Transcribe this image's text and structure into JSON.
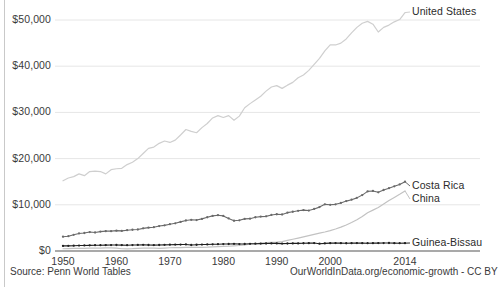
{
  "axes": {
    "y_ticks": [
      {
        "label": "$50,000",
        "value": 50000
      },
      {
        "label": "$40,000",
        "value": 40000
      },
      {
        "label": "$30,000",
        "value": 30000
      },
      {
        "label": "$20,000",
        "value": 20000
      },
      {
        "label": "$10,000",
        "value": 10000
      },
      {
        "label": "$0",
        "value": 0
      }
    ],
    "x_ticks": [
      {
        "label": "1950",
        "value": 1950
      },
      {
        "label": "1960",
        "value": 1960
      },
      {
        "label": "1970",
        "value": 1970
      },
      {
        "label": "1980",
        "value": 1980
      },
      {
        "label": "1990",
        "value": 1990
      },
      {
        "label": "2000",
        "value": 2000
      },
      {
        "label": "2014",
        "value": 2014
      }
    ]
  },
  "series_labels": {
    "united_states": "United States",
    "costa_rica": "Costa Rica",
    "china": "China",
    "guinea_bissau": "Guinea-Bissau"
  },
  "footer": {
    "source": "Source: Penn World Tables",
    "attribution": "OurWorldInData.org/economic-growth - CC BY"
  },
  "colors": {
    "united_states": "#cfcfcf",
    "costa_rica": "#6a6a6a",
    "china": "#c2c2c2",
    "guinea_bissau": "#1f1f1f",
    "gridline": "#e6e6e6",
    "axis": "#8c8c8c",
    "text": "#2b2b2b",
    "background": "#ffffff"
  },
  "chart_data": {
    "type": "line",
    "title": "",
    "subtitle": "",
    "xlabel": "",
    "ylabel": "",
    "xlim": [
      1950,
      2014
    ],
    "ylim": [
      0,
      55000
    ],
    "grid": true,
    "legend_position": "right-inline",
    "x": [
      1950,
      1951,
      1952,
      1953,
      1954,
      1955,
      1956,
      1957,
      1958,
      1959,
      1960,
      1961,
      1962,
      1963,
      1964,
      1965,
      1966,
      1967,
      1968,
      1969,
      1970,
      1971,
      1972,
      1973,
      1974,
      1975,
      1976,
      1977,
      1978,
      1979,
      1980,
      1981,
      1982,
      1983,
      1984,
      1985,
      1986,
      1987,
      1988,
      1989,
      1990,
      1991,
      1992,
      1993,
      1994,
      1995,
      1996,
      1997,
      1998,
      1999,
      2000,
      2001,
      2002,
      2003,
      2004,
      2005,
      2006,
      2007,
      2008,
      2009,
      2010,
      2011,
      2012,
      2013,
      2014
    ],
    "series": [
      {
        "name": "United States",
        "color": "#cfcfcf",
        "markers": false,
        "values": [
          15200,
          15800,
          16100,
          16700,
          16300,
          17200,
          17300,
          17200,
          16700,
          17600,
          17800,
          17900,
          18700,
          19200,
          20000,
          21100,
          22200,
          22500,
          23300,
          23800,
          23500,
          24000,
          25100,
          26300,
          25900,
          25600,
          26700,
          27600,
          28800,
          29300,
          28900,
          29300,
          28300,
          29200,
          31000,
          31900,
          32700,
          33500,
          34600,
          35500,
          35800,
          35200,
          35900,
          36500,
          37500,
          38100,
          39100,
          40400,
          41700,
          43300,
          44600,
          44600,
          45000,
          45900,
          47200,
          48400,
          49300,
          49700,
          49100,
          47400,
          48400,
          48900,
          49600,
          50100,
          51600
        ]
      },
      {
        "name": "Costa Rica",
        "color": "#6a6a6a",
        "markers": true,
        "values": [
          3100,
          3200,
          3500,
          3800,
          3900,
          4100,
          4000,
          4200,
          4300,
          4300,
          4400,
          4350,
          4500,
          4600,
          4650,
          4900,
          5050,
          5150,
          5400,
          5550,
          5800,
          6000,
          6300,
          6600,
          6750,
          6700,
          6950,
          7300,
          7600,
          7750,
          7600,
          7050,
          6550,
          6650,
          6950,
          7000,
          7300,
          7450,
          7500,
          7800,
          7950,
          7900,
          8300,
          8500,
          8700,
          8850,
          8750,
          9100,
          9500,
          10100,
          10000,
          10100,
          10400,
          10800,
          11100,
          11500,
          12100,
          12900,
          13000,
          12700,
          13200,
          13600,
          14000,
          14400,
          15000
        ]
      },
      {
        "name": "China",
        "color": "#c2c2c2",
        "markers": false,
        "values": [
          800,
          850,
          900,
          930,
          960,
          980,
          1030,
          1040,
          1120,
          1080,
          1000,
          800,
          780,
          830,
          920,
          1010,
          1060,
          1000,
          960,
          1030,
          1140,
          1190,
          1200,
          1260,
          1270,
          1330,
          1280,
          1340,
          1450,
          1540,
          1620,
          1670,
          1790,
          1950,
          2180,
          2390,
          2540,
          2770,
          3000,
          3060,
          3100,
          3340,
          3750,
          4150,
          4570,
          5000,
          5440,
          5880,
          6280,
          6710,
          7210,
          7780,
          8440,
          9200,
          10050,
          11030,
          12180,
          13480,
          14430,
          15380,
          16600,
          17800,
          18900,
          20000,
          21200
        ],
        "display_values_note": "plotted on chart scale reaching approximately $13,000 at 2014"
      },
      {
        "name": "Guinea-Bissau",
        "color": "#1f1f1f",
        "markers": true,
        "values": [
          1100,
          1120,
          1150,
          1180,
          1200,
          1220,
          1250,
          1260,
          1280,
          1290,
          1300,
          1280,
          1260,
          1290,
          1310,
          1330,
          1300,
          1280,
          1300,
          1330,
          1360,
          1380,
          1400,
          1420,
          1300,
          1350,
          1400,
          1420,
          1450,
          1470,
          1500,
          1520,
          1550,
          1500,
          1520,
          1560,
          1580,
          1600,
          1620,
          1650,
          1640,
          1600,
          1620,
          1640,
          1650,
          1680,
          1700,
          1720,
          1580,
          1650,
          1700,
          1720,
          1700,
          1680,
          1700,
          1710,
          1700,
          1690,
          1700,
          1710,
          1720,
          1730,
          1700,
          1690,
          1700
        ]
      }
    ]
  }
}
